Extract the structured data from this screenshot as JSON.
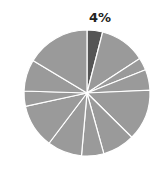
{
  "chart_data": {
    "type": "pie",
    "title": "",
    "highlight_label": "4%",
    "colors": {
      "highlight": "#555555",
      "other": "#9a9a9a",
      "separator": "#ffffff"
    },
    "slices": [
      {
        "value": 4,
        "highlight": true,
        "label": "4%"
      },
      {
        "value": 11.8
      },
      {
        "value": 3.2
      },
      {
        "value": 5.3
      },
      {
        "value": 13.1
      },
      {
        "value": 8.3
      },
      {
        "value": 5.7
      },
      {
        "value": 8.9
      },
      {
        "value": 11.3
      },
      {
        "value": 3.9
      },
      {
        "value": 8.1
      },
      {
        "value": 16.4
      }
    ],
    "legend": null
  }
}
